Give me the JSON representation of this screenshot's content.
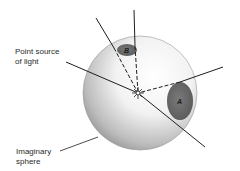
{
  "diagram": {
    "labels": {
      "point_source": "Point source\nof light",
      "imaginary_sphere": "Imaginary\nsphere"
    },
    "regions": {
      "a": "A",
      "b": "B"
    },
    "colors": {
      "sphere_shade": "#9a9a9a",
      "region_fill": "#6e6e6e",
      "line": "#1e1e1e"
    }
  }
}
